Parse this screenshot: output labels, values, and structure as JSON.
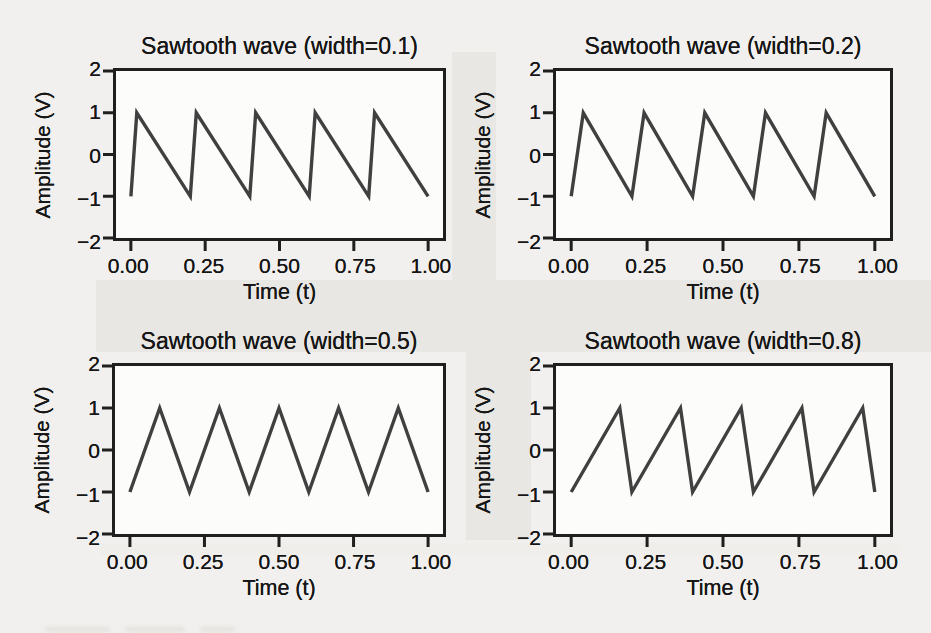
{
  "figure": {
    "page_background": "#f1f0ee",
    "plot_background": "#fcfcfb",
    "axis_color": "#1f1f1f",
    "text_color": "#161616",
    "line_color": "#404040",
    "shading_color": "#e8e7e3"
  },
  "chart_data": [
    {
      "type": "line",
      "title": "Sawtooth wave (width=0.1)",
      "xlabel": "Time (t)",
      "ylabel": "Amplitude (V)",
      "width_param": 0.1,
      "cycles_shown": 5,
      "xlim": [
        -0.05,
        1.05
      ],
      "ylim": [
        -2,
        2
      ],
      "xticks": [
        "0.00",
        "0.25",
        "0.50",
        "0.75",
        "1.00"
      ],
      "yticks": [
        "2",
        "1",
        "0",
        "−1",
        "−2"
      ],
      "xtick_values": [
        0,
        0.25,
        0.5,
        0.75,
        1
      ],
      "ytick_values": [
        2,
        1,
        0,
        -1,
        -2
      ],
      "points": [
        [
          0,
          -1
        ],
        [
          0.02,
          1
        ],
        [
          0.2,
          -1
        ],
        [
          0.22,
          1
        ],
        [
          0.4,
          -1
        ],
        [
          0.42,
          1
        ],
        [
          0.6,
          -1
        ],
        [
          0.62,
          1
        ],
        [
          0.8,
          -1
        ],
        [
          0.82,
          1
        ],
        [
          1.0,
          -1
        ]
      ]
    },
    {
      "type": "line",
      "title": "Sawtooth wave (width=0.2)",
      "xlabel": "Time (t)",
      "ylabel": "Amplitude (V)",
      "width_param": 0.2,
      "cycles_shown": 5,
      "xlim": [
        -0.05,
        1.05
      ],
      "ylim": [
        -2,
        2
      ],
      "xticks": [
        "0.00",
        "0.25",
        "0.50",
        "0.75",
        "1.00"
      ],
      "yticks": [
        "2",
        "1",
        "0",
        "−1",
        "−2"
      ],
      "xtick_values": [
        0,
        0.25,
        0.5,
        0.75,
        1
      ],
      "ytick_values": [
        2,
        1,
        0,
        -1,
        -2
      ],
      "points": [
        [
          0,
          -1
        ],
        [
          0.04,
          1
        ],
        [
          0.2,
          -1
        ],
        [
          0.24,
          1
        ],
        [
          0.4,
          -1
        ],
        [
          0.44,
          1
        ],
        [
          0.6,
          -1
        ],
        [
          0.64,
          1
        ],
        [
          0.8,
          -1
        ],
        [
          0.84,
          1
        ],
        [
          1.0,
          -1
        ]
      ]
    },
    {
      "type": "line",
      "title": "Sawtooth wave (width=0.5)",
      "xlabel": "Time (t)",
      "ylabel": "Amplitude (V)",
      "width_param": 0.5,
      "cycles_shown": 5,
      "xlim": [
        -0.05,
        1.05
      ],
      "ylim": [
        -2,
        2
      ],
      "xticks": [
        "0.00",
        "0.25",
        "0.50",
        "0.75",
        "1.00"
      ],
      "yticks": [
        "2",
        "1",
        "0",
        "−1",
        "−2"
      ],
      "xtick_values": [
        0,
        0.25,
        0.5,
        0.75,
        1
      ],
      "ytick_values": [
        2,
        1,
        0,
        -1,
        -2
      ],
      "points": [
        [
          0,
          -1
        ],
        [
          0.1,
          1
        ],
        [
          0.2,
          -1
        ],
        [
          0.3,
          1
        ],
        [
          0.4,
          -1
        ],
        [
          0.5,
          1
        ],
        [
          0.6,
          -1
        ],
        [
          0.7,
          1
        ],
        [
          0.8,
          -1
        ],
        [
          0.9,
          1
        ],
        [
          1.0,
          -1
        ]
      ]
    },
    {
      "type": "line",
      "title": "Sawtooth wave (width=0.8)",
      "xlabel": "Time (t)",
      "ylabel": "Amplitude (V)",
      "width_param": 0.8,
      "cycles_shown": 5,
      "xlim": [
        -0.05,
        1.05
      ],
      "ylim": [
        -2,
        2
      ],
      "xticks": [
        "0.00",
        "0.25",
        "0.50",
        "0.75",
        "1.00"
      ],
      "yticks": [
        "2",
        "1",
        "0",
        "−1",
        "−2"
      ],
      "xtick_values": [
        0,
        0.25,
        0.5,
        0.75,
        1
      ],
      "ytick_values": [
        2,
        1,
        0,
        -1,
        -2
      ],
      "points": [
        [
          0,
          -1
        ],
        [
          0.16,
          1
        ],
        [
          0.2,
          -1
        ],
        [
          0.36,
          1
        ],
        [
          0.4,
          -1
        ],
        [
          0.56,
          1
        ],
        [
          0.6,
          -1
        ],
        [
          0.76,
          1
        ],
        [
          0.8,
          -1
        ],
        [
          0.96,
          1
        ],
        [
          1.0,
          -1
        ]
      ]
    }
  ]
}
